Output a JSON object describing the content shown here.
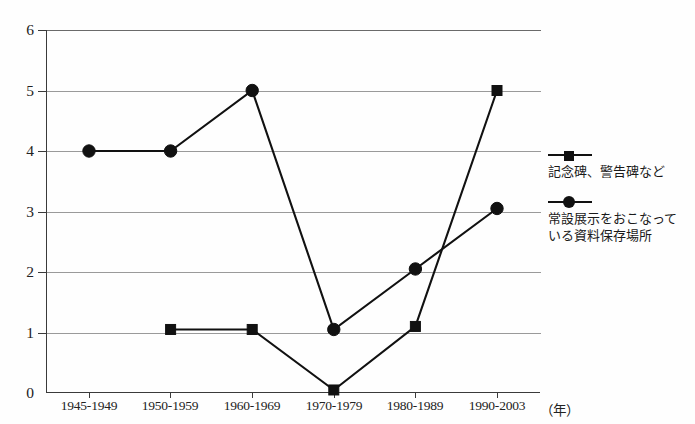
{
  "chart_data": {
    "type": "line",
    "title": "",
    "xlabel": "",
    "ylabel": "",
    "x_unit_label": "（年）",
    "categories": [
      "1945-1949",
      "1950-1959",
      "1960-1969",
      "1970-1979",
      "1980-1989",
      "1990-2003"
    ],
    "ylim": [
      0,
      6
    ],
    "y_ticks": [
      0,
      1,
      2,
      3,
      4,
      5,
      6
    ],
    "grid": "horizontal",
    "legend_position": "right",
    "series": [
      {
        "name": "記念碑、警告碑など",
        "marker": "square",
        "color": "#111111",
        "values": [
          null,
          1.05,
          1.05,
          0.05,
          1.1,
          5.0
        ]
      },
      {
        "name": "常設展示をおこなっている資料保存場所",
        "marker": "circle",
        "color": "#111111",
        "values": [
          4.0,
          4.0,
          5.0,
          1.05,
          2.05,
          3.05
        ]
      }
    ]
  },
  "legend": {
    "entries": [
      {
        "label": "記念碑、警告碑など",
        "marker": "square"
      },
      {
        "label_line1": "常設展示をおこなって",
        "label_line2": "いる資料保存場所",
        "marker": "circle"
      }
    ]
  },
  "axis": {
    "y_tick_labels": [
      "6",
      "5",
      "4",
      "3",
      "2",
      "1",
      "0"
    ],
    "x_tick_labels": [
      "1945-1949",
      "1950-1959",
      "1960-1969",
      "1970-1979",
      "1980-1989",
      "1990-2003"
    ],
    "x_unit": "（年）"
  }
}
